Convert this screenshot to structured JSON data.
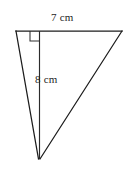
{
  "figure": {
    "kind": "geometry-diagram",
    "shape": "triangle",
    "background_color": "#ffffff",
    "stroke_color": "#1c1c1c",
    "text_color": "#242424",
    "labels": {
      "base": "7 cm",
      "height": "8 cm"
    },
    "measurements": {
      "base_length": 7,
      "height_length": 8,
      "unit": "cm"
    },
    "annotations": {
      "right_angle": "right-angle-marker"
    },
    "geometry": {
      "vertex_top_left": [
        16,
        31
      ],
      "vertex_top_right": [
        122,
        31
      ],
      "vertex_bottom_apex": [
        39,
        159
      ],
      "altitude_foot": [
        39,
        31
      ],
      "right_angle_square": [
        30,
        31,
        10,
        10
      ]
    }
  }
}
